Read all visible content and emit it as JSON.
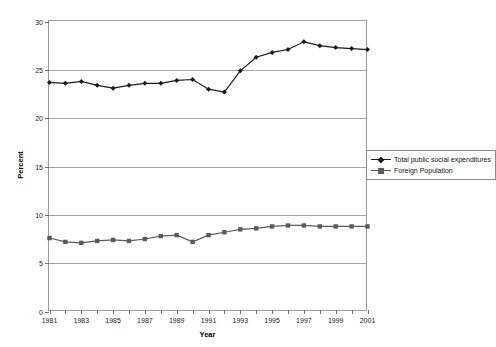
{
  "chart_data": {
    "type": "line",
    "title": "",
    "xlabel": "Year",
    "ylabel": "Percent",
    "xlim": [
      1981,
      2001
    ],
    "ylim": [
      0,
      30
    ],
    "ytick_step": 5,
    "grid": true,
    "legend_position": "right-middle",
    "x": [
      1981,
      1982,
      1983,
      1984,
      1985,
      1986,
      1987,
      1988,
      1989,
      1990,
      1991,
      1992,
      1993,
      1994,
      1995,
      1996,
      1997,
      1998,
      1999,
      2000,
      2001
    ],
    "xtick_labels": [
      "1981",
      "",
      "1983",
      "",
      "1985",
      "",
      "1987",
      "",
      "1989",
      "",
      "1991",
      "",
      "1993",
      "",
      "1995",
      "",
      "1997",
      "",
      "1999",
      "",
      "2001"
    ],
    "ytick_labels": [
      "0",
      "5",
      "10",
      "15",
      "20",
      "25",
      "30"
    ],
    "series": [
      {
        "name": "Total public social expenditures",
        "marker": "diamond",
        "color": "#1a1a1a",
        "values": [
          23.7,
          23.6,
          23.8,
          23.4,
          23.1,
          23.4,
          23.6,
          23.6,
          23.9,
          24.0,
          23.0,
          22.7,
          24.9,
          26.3,
          26.8,
          27.1,
          27.9,
          27.5,
          27.3,
          27.2,
          27.1
        ]
      },
      {
        "name": "Foreign Population",
        "marker": "square",
        "color": "#5a5a5a",
        "values": [
          7.6,
          7.2,
          7.1,
          7.3,
          7.4,
          7.3,
          7.5,
          7.8,
          7.9,
          7.2,
          7.9,
          8.2,
          8.5,
          8.6,
          8.8,
          8.9,
          8.9,
          8.8,
          8.8,
          8.8,
          8.8
        ]
      }
    ]
  },
  "legend": {
    "items": [
      {
        "label": "Total public social expenditures"
      },
      {
        "label": "Foreign Population"
      }
    ]
  }
}
